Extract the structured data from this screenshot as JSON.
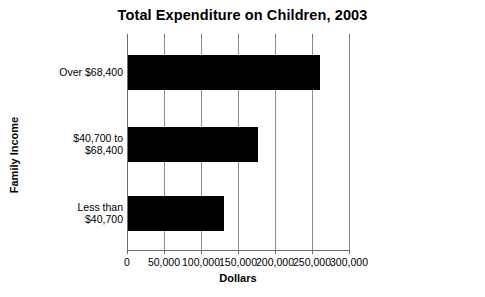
{
  "chart_data": {
    "type": "bar",
    "orientation": "horizontal",
    "title": "Total Expenditure on Children, 2003",
    "xlabel": "Dollars",
    "ylabel": "Family Income",
    "categories": [
      "Less than\n$40,700",
      "$40,700 to\n$68,400",
      "Over $68,400"
    ],
    "values": [
      130000,
      175000,
      260000
    ],
    "xlim": [
      0,
      300000
    ],
    "xticks": [
      0,
      50000,
      100000,
      150000,
      200000,
      250000,
      300000
    ],
    "xtick_labels": [
      "0",
      "50,000",
      "100,000",
      "150,000",
      "200,000",
      "250,000",
      "300,000"
    ],
    "grid": true,
    "grid_axis": "x",
    "legend": false,
    "bar_color": "#000000",
    "grid_color": "#8a8a8a",
    "background_color": "#ffffff"
  },
  "series_rows": [
    {
      "label": "Over $68,400",
      "value": 260000
    },
    {
      "label": "$40,700 to\n$68,400",
      "value": 175000
    },
    {
      "label": "Less than\n$40,700",
      "value": 130000
    }
  ]
}
